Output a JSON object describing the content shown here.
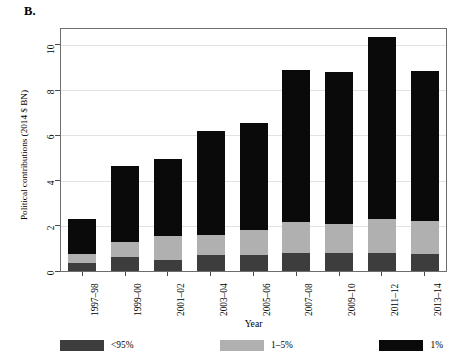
{
  "figure": {
    "panel_label": "B.",
    "ylabel": "Political contributions (2014 $ BN)",
    "xlabel": "Year"
  },
  "legend": {
    "items": [
      {
        "label": "<95%",
        "color": "#3d3d3d",
        "name": "legend-under-95"
      },
      {
        "label": "1–5%",
        "color": "#b0b0b0",
        "name": "legend-1-to-5"
      },
      {
        "label": "1%",
        "color": "#0a0a0a",
        "name": "legend-1-percent"
      }
    ]
  },
  "axes": {
    "yticks": [
      "0",
      "2",
      "4",
      "6",
      "8",
      "10"
    ],
    "xticks": [
      "1997–98",
      "1999–00",
      "2001–02",
      "2003–04",
      "2005–06",
      "2007–08",
      "2009–10",
      "2011–12",
      "2013–14"
    ]
  },
  "chart_data": {
    "type": "bar",
    "subtype": "stacked-vertical",
    "title": "B.",
    "xlabel": "Year",
    "ylabel": "Political contributions (2014 $ BN)",
    "ylim": [
      0,
      10.7
    ],
    "yticks": [
      0,
      2,
      4,
      6,
      8,
      10
    ],
    "grid": "horizontal",
    "legend_position": "bottom",
    "categories": [
      "1997–98",
      "1999–00",
      "2001–02",
      "2003–04",
      "2005–06",
      "2007–08",
      "2009–10",
      "2011–12",
      "2013–14"
    ],
    "series": [
      {
        "name": "<95%",
        "color": "#3d3d3d",
        "values": [
          0.35,
          0.6,
          0.5,
          0.7,
          0.7,
          0.8,
          0.8,
          0.8,
          0.75
        ]
      },
      {
        "name": "1–5%",
        "color": "#b0b0b0",
        "values": [
          0.4,
          0.7,
          1.05,
          0.9,
          1.1,
          1.35,
          1.3,
          1.5,
          1.45
        ]
      },
      {
        "name": "1%",
        "color": "#0a0a0a",
        "values": [
          1.55,
          3.35,
          3.4,
          4.6,
          4.75,
          6.75,
          6.7,
          8.05,
          6.65
        ]
      }
    ],
    "totals": [
      2.3,
      4.65,
      4.95,
      6.2,
      6.55,
      8.9,
      8.8,
      10.35,
      8.85
    ]
  }
}
